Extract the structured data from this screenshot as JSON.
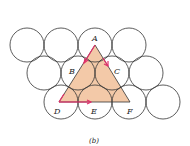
{
  "figure": {
    "caption": "(b)",
    "labels": {
      "A": "A",
      "B": "B",
      "C": "C",
      "D": "D",
      "E": "E",
      "F": "F"
    },
    "colors": {
      "circle_stroke": "#333333",
      "triangle_fill": "#f3c9a8",
      "arrow": "#e0306a"
    },
    "circles": {
      "radius": 17,
      "rows": [
        {
          "y": 45,
          "x": [
            27,
            61,
            95,
            129
          ]
        },
        {
          "y": 73,
          "x": [
            44,
            78,
            112,
            146
          ]
        },
        {
          "y": 102,
          "x": [
            61,
            95,
            129,
            163
          ]
        }
      ]
    }
  }
}
